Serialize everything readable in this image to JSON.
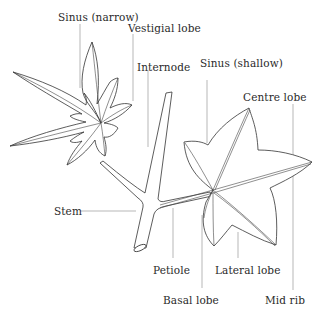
{
  "diagram": {
    "labels": {
      "sinus_narrow": "Sinus (narrow)",
      "vestigial_lobe": "Vestigial lobe",
      "internode": "Internode",
      "sinus_shallow": "Sinus (shallow)",
      "centre_lobe": "Centre lobe",
      "stem": "Stem",
      "petiole": "Petiole",
      "lateral_lobe": "Lateral lobe",
      "basal_lobe": "Basal lobe",
      "mid_rib": "Mid rib"
    },
    "colors": {
      "line": "#333333",
      "leader": "#9a9a9a",
      "text": "#2a2a2a",
      "background": "#ffffff"
    }
  }
}
